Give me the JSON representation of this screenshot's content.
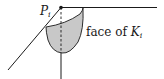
{
  "diagram": {
    "point_label": {
      "base": "P",
      "subscript": "i"
    },
    "face_label": {
      "text": "face of ",
      "math_base": "K",
      "math_subscript": "i"
    },
    "colors": {
      "stroke": "#1a1a1a",
      "face_fill": "#c8c8c8",
      "background": "#ffffff"
    },
    "elements": [
      "point P_i",
      "horizontal edge",
      "diagonal edge",
      "vertical edge",
      "dashed vertical projection",
      "shaded face of K_i"
    ]
  }
}
